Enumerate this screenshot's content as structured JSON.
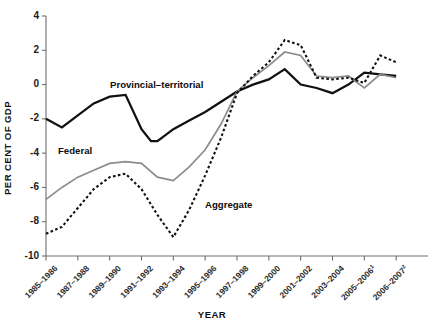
{
  "chart_data": {
    "type": "line",
    "title": "",
    "xlabel": "YEAR",
    "ylabel": "PER CENT OF GDP",
    "grid": false,
    "legend_position": "inline-annotations",
    "ylim": [
      -10,
      4
    ],
    "yticks": [
      4,
      2,
      0,
      -2,
      -4,
      -6,
      -8,
      -10
    ],
    "ytick_labels": [
      "4",
      "2",
      "0",
      "-2",
      "-4",
      "-6",
      "-8",
      "-10"
    ],
    "categories": [
      "1985–1986",
      "1987–1988",
      "1989–1990",
      "1991–1992",
      "1993–1994",
      "1995–1996",
      "1997–1998",
      "1999–2000",
      "2001–2002",
      "2003–2004",
      "2005–2006",
      "2006–2007"
    ],
    "category_superscripts": [
      "",
      "",
      "",
      "",
      "",
      "",
      "",
      "",
      "",
      "",
      "1",
      "2"
    ],
    "series": [
      {
        "name": "Provincial–territorial",
        "style": "solid",
        "color": "#111111",
        "width": 2.3,
        "x": [
          0,
          0.5,
          1,
          1.5,
          2,
          2.5,
          3,
          3.3,
          3.5,
          4,
          4.5,
          5,
          5.5,
          6,
          6.5,
          7,
          7.5,
          8,
          8.5,
          9,
          9.5,
          10,
          10.5,
          11
        ],
        "values": [
          -2.0,
          -2.5,
          -1.8,
          -1.1,
          -0.7,
          -0.6,
          -2.6,
          -3.3,
          -3.3,
          -2.6,
          -2.1,
          -1.6,
          -1.0,
          -0.4,
          0.0,
          0.3,
          0.9,
          0.0,
          -0.2,
          -0.5,
          0.0,
          0.7,
          0.6,
          0.5
        ]
      },
      {
        "name": "Federal",
        "style": "solid",
        "color": "#8c8c8c",
        "width": 1.7,
        "x": [
          0,
          0.5,
          1,
          1.5,
          2,
          2.5,
          3,
          3.5,
          4,
          4.5,
          5,
          5.5,
          6,
          6.5,
          7,
          7.5,
          8,
          8.5,
          9,
          9.5,
          10,
          10.5,
          11
        ],
        "values": [
          -6.7,
          -6.0,
          -5.4,
          -5.0,
          -4.6,
          -4.5,
          -4.6,
          -5.4,
          -5.6,
          -4.8,
          -3.8,
          -2.3,
          -0.4,
          0.4,
          1.1,
          1.9,
          1.7,
          0.5,
          0.4,
          0.5,
          -0.2,
          0.6,
          0.4
        ]
      },
      {
        "name": "Aggregate",
        "style": "dotted",
        "color": "#111111",
        "width": 2.1,
        "x": [
          0,
          0.5,
          1,
          1.5,
          2,
          2.5,
          3,
          3.5,
          4,
          4.5,
          5,
          5.5,
          6,
          6.5,
          7,
          7.5,
          8,
          8.5,
          9,
          9.5,
          10,
          10.5,
          11
        ],
        "values": [
          -8.7,
          -8.3,
          -7.2,
          -6.1,
          -5.4,
          -5.2,
          -6.1,
          -7.6,
          -8.9,
          -7.3,
          -5.3,
          -3.1,
          -0.5,
          0.5,
          1.3,
          2.6,
          2.3,
          0.4,
          0.3,
          0.4,
          0.1,
          1.7,
          1.3
        ]
      }
    ],
    "annotations": [
      {
        "text": "Provincial–territorial",
        "x_px": 110,
        "y_px": 88
      },
      {
        "text": "Federal",
        "x_px": 58,
        "y_px": 154
      },
      {
        "text": "Aggregate",
        "x_px": 205,
        "y_px": 208
      }
    ]
  },
  "axes": {
    "y_title": "PER CENT OF GDP",
    "x_title": "YEAR"
  }
}
